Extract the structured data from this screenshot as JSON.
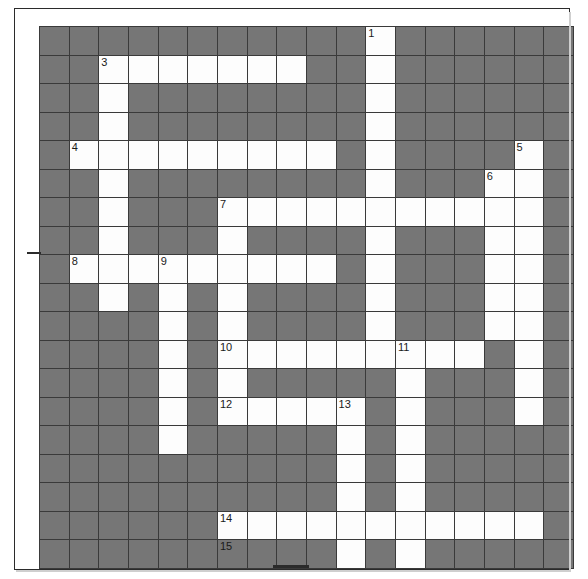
{
  "puzzle": {
    "title": "Crossword Grid",
    "rows": 19,
    "columns": 18,
    "colors": {
      "block": "#767676",
      "cell": "#fdfdfd",
      "gridline": "#3a3a3a",
      "number_text": "#1a1a1a",
      "page_background": "#ffffff"
    },
    "clue_numbers_visible": [
      "1",
      "3",
      "4",
      "5",
      "6",
      "7",
      "8",
      "9",
      "10",
      "11",
      "12",
      "13",
      "14",
      "15"
    ],
    "layout": [
      [
        "block",
        "block",
        "block",
        "block",
        "block",
        "block",
        "block",
        "block",
        "block",
        "block",
        "block",
        "cell",
        "block",
        "block",
        "block",
        "block",
        "block",
        "block"
      ],
      [
        "block",
        "block",
        "cell",
        "cell",
        "cell",
        "cell",
        "cell",
        "cell",
        "cell",
        "block",
        "block",
        "cell",
        "block",
        "block",
        "block",
        "block",
        "block",
        "block"
      ],
      [
        "block",
        "block",
        "cell",
        "block",
        "block",
        "block",
        "block",
        "block",
        "block",
        "block",
        "block",
        "cell",
        "block",
        "block",
        "block",
        "block",
        "block",
        "block"
      ],
      [
        "block",
        "block",
        "cell",
        "block",
        "block",
        "block",
        "block",
        "block",
        "block",
        "block",
        "block",
        "cell",
        "block",
        "block",
        "block",
        "block",
        "block",
        "block"
      ],
      [
        "block",
        "cell",
        "cell",
        "cell",
        "cell",
        "cell",
        "cell",
        "cell",
        "cell",
        "cell",
        "block",
        "cell",
        "block",
        "block",
        "block",
        "block",
        "cell",
        "block"
      ],
      [
        "block",
        "block",
        "cell",
        "block",
        "block",
        "block",
        "block",
        "block",
        "block",
        "block",
        "block",
        "cell",
        "block",
        "block",
        "block",
        "cell",
        "cell",
        "block"
      ],
      [
        "block",
        "block",
        "cell",
        "block",
        "block",
        "block",
        "cell",
        "cell",
        "cell",
        "cell",
        "cell",
        "cell",
        "cell",
        "cell",
        "cell",
        "cell",
        "cell",
        "block"
      ],
      [
        "block",
        "block",
        "cell",
        "block",
        "block",
        "block",
        "cell",
        "block",
        "block",
        "block",
        "block",
        "cell",
        "block",
        "block",
        "block",
        "cell",
        "cell",
        "block"
      ],
      [
        "block",
        "cell",
        "cell",
        "cell",
        "cell",
        "cell",
        "cell",
        "cell",
        "cell",
        "cell",
        "block",
        "cell",
        "block",
        "block",
        "block",
        "cell",
        "cell",
        "block"
      ],
      [
        "block",
        "block",
        "cell",
        "block",
        "cell",
        "block",
        "cell",
        "block",
        "block",
        "block",
        "block",
        "cell",
        "block",
        "block",
        "block",
        "cell",
        "cell",
        "block"
      ],
      [
        "block",
        "block",
        "block",
        "block",
        "cell",
        "block",
        "cell",
        "block",
        "block",
        "block",
        "block",
        "cell",
        "block",
        "block",
        "block",
        "cell",
        "cell",
        "block"
      ],
      [
        "block",
        "block",
        "block",
        "block",
        "cell",
        "block",
        "cell",
        "cell",
        "cell",
        "cell",
        "cell",
        "cell",
        "cell",
        "cell",
        "cell",
        "block",
        "cell",
        "block"
      ],
      [
        "block",
        "block",
        "block",
        "block",
        "cell",
        "block",
        "cell",
        "block",
        "block",
        "block",
        "block",
        "block",
        "cell",
        "block",
        "block",
        "block",
        "cell",
        "block"
      ],
      [
        "block",
        "block",
        "block",
        "block",
        "cell",
        "block",
        "cell",
        "cell",
        "cell",
        "cell",
        "cell",
        "block",
        "cell",
        "block",
        "block",
        "block",
        "cell",
        "block"
      ],
      [
        "block",
        "block",
        "block",
        "block",
        "cell",
        "block",
        "block",
        "block",
        "block",
        "block",
        "cell",
        "block",
        "cell",
        "block",
        "block",
        "block",
        "block",
        "block"
      ],
      [
        "block",
        "block",
        "block",
        "block",
        "block",
        "block",
        "block",
        "block",
        "block",
        "block",
        "cell",
        "block",
        "cell",
        "block",
        "block",
        "block",
        "block",
        "block"
      ],
      [
        "block",
        "block",
        "block",
        "block",
        "block",
        "block",
        "block",
        "block",
        "block",
        "block",
        "cell",
        "block",
        "cell",
        "block",
        "block",
        "block",
        "block",
        "block"
      ],
      [
        "block",
        "block",
        "block",
        "block",
        "block",
        "block",
        "cell",
        "cell",
        "cell",
        "cell",
        "cell",
        "cell",
        "cell",
        "cell",
        "cell",
        "cell",
        "cell",
        "block"
      ],
      [
        "block",
        "block",
        "block",
        "block",
        "block",
        "block",
        "block",
        "block",
        "block",
        "block",
        "cell",
        "block",
        "cell",
        "block",
        "block",
        "block",
        "block",
        "block"
      ]
    ],
    "numbers": [
      {
        "row": 0,
        "col": 11,
        "label": "1"
      },
      {
        "row": 1,
        "col": 2,
        "label": "3"
      },
      {
        "row": 4,
        "col": 1,
        "label": "4"
      },
      {
        "row": 4,
        "col": 16,
        "label": "5"
      },
      {
        "row": 5,
        "col": 15,
        "label": "6"
      },
      {
        "row": 6,
        "col": 6,
        "label": "7"
      },
      {
        "row": 8,
        "col": 1,
        "label": "8"
      },
      {
        "row": 8,
        "col": 4,
        "label": "9"
      },
      {
        "row": 11,
        "col": 6,
        "label": "10"
      },
      {
        "row": 11,
        "col": 12,
        "label": "11"
      },
      {
        "row": 13,
        "col": 6,
        "label": "12"
      },
      {
        "row": 13,
        "col": 10,
        "label": "13"
      },
      {
        "row": 18,
        "col": 6,
        "label": "15"
      },
      {
        "row": 17,
        "col": 6,
        "label": "14"
      }
    ]
  }
}
